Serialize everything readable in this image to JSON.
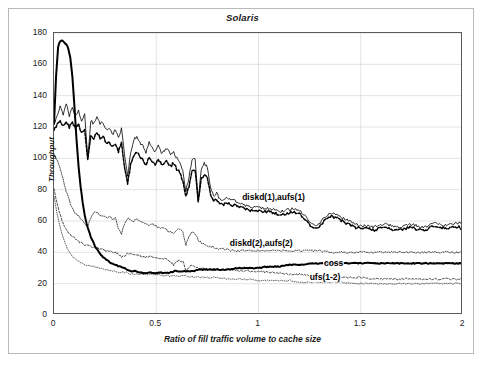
{
  "chart_data": {
    "type": "line",
    "title": "Solaris",
    "xlabel": "Ratio of fill traffic volume to cache size",
    "ylabel": "Throughput",
    "xlim": [
      0,
      2
    ],
    "ylim": [
      0,
      180
    ],
    "xticks": [
      "0",
      "0.5",
      "1",
      "1.5",
      "2"
    ],
    "xtick_values": [
      0,
      0.5,
      1,
      1.5,
      2
    ],
    "yticks": [
      "0",
      "20",
      "40",
      "60",
      "80",
      "100",
      "120",
      "140",
      "160",
      "180"
    ],
    "ytick_values": [
      0,
      20,
      40,
      60,
      80,
      100,
      120,
      140,
      160,
      180
    ],
    "grid": true,
    "grid_axis": "y",
    "legend": "inline-annotations",
    "annotations": [
      {
        "text": "diskd(1),aufs(1)",
        "x": 0.92,
        "y": 74
      },
      {
        "text": "diskd(2),aufs(2)",
        "x": 0.86,
        "y": 45
      },
      {
        "text": "coss",
        "x": 1.32,
        "y": 32
      },
      {
        "text": "ufs(1-2)",
        "x": 1.25,
        "y": 23
      }
    ],
    "series": [
      {
        "name": "aufs(1)",
        "style": "solid-thin",
        "color": "#000000",
        "x": [
          0,
          0.015,
          0.03,
          0.045,
          0.06,
          0.075,
          0.09,
          0.105,
          0.12,
          0.135,
          0.15,
          0.165,
          0.18,
          0.195,
          0.21,
          0.225,
          0.24,
          0.255,
          0.27,
          0.285,
          0.3,
          0.315,
          0.33,
          0.345,
          0.36,
          0.375,
          0.39,
          0.405,
          0.42,
          0.435,
          0.45,
          0.465,
          0.48,
          0.495,
          0.51,
          0.525,
          0.54,
          0.555,
          0.57,
          0.585,
          0.6,
          0.615,
          0.63,
          0.645,
          0.66,
          0.675,
          0.69,
          0.705,
          0.72,
          0.735,
          0.75,
          0.765,
          0.78,
          0.795,
          0.81,
          0.825,
          0.84,
          0.855,
          0.87,
          0.885,
          0.9,
          0.93,
          0.96,
          0.99,
          1.02,
          1.05,
          1.08,
          1.11,
          1.14,
          1.17,
          1.2,
          1.23,
          1.26,
          1.29,
          1.32,
          1.35,
          1.38,
          1.41,
          1.44,
          1.47,
          1.5,
          1.53,
          1.56,
          1.59,
          1.62,
          1.65,
          1.68,
          1.71,
          1.74,
          1.77,
          1.8,
          1.83,
          1.86,
          1.89,
          1.92,
          1.95,
          1.98,
          2
        ],
        "y": [
          121,
          127,
          133,
          128,
          135,
          127,
          132,
          127,
          131,
          123,
          128,
          100,
          124,
          122,
          126,
          122,
          123,
          118,
          120,
          115,
          118,
          113,
          119,
          103,
          88,
          104,
          112,
          114,
          110,
          108,
          104,
          110,
          107,
          104,
          108,
          103,
          105,
          106,
          102,
          104,
          100,
          98,
          92,
          79,
          88,
          99,
          100,
          73,
          93,
          97,
          94,
          82,
          76,
          78,
          74,
          73,
          75,
          74,
          73,
          73,
          72,
          70,
          69,
          69,
          68,
          68,
          67,
          66,
          67,
          68,
          67,
          63,
          58,
          57,
          62,
          65,
          64,
          62,
          60,
          58,
          57,
          57,
          56,
          57,
          58,
          57,
          56,
          57,
          58,
          57,
          56,
          57,
          59,
          58,
          57,
          58,
          59,
          57
        ]
      },
      {
        "name": "diskd(1)",
        "style": "dashed-bold",
        "color": "#000000",
        "x": [
          0,
          0.015,
          0.03,
          0.045,
          0.06,
          0.075,
          0.09,
          0.105,
          0.12,
          0.135,
          0.15,
          0.165,
          0.18,
          0.195,
          0.21,
          0.225,
          0.24,
          0.255,
          0.27,
          0.285,
          0.3,
          0.315,
          0.33,
          0.345,
          0.36,
          0.375,
          0.39,
          0.405,
          0.42,
          0.435,
          0.45,
          0.465,
          0.48,
          0.495,
          0.51,
          0.525,
          0.54,
          0.555,
          0.57,
          0.585,
          0.6,
          0.615,
          0.63,
          0.645,
          0.66,
          0.675,
          0.69,
          0.705,
          0.72,
          0.735,
          0.75,
          0.765,
          0.78,
          0.795,
          0.81,
          0.825,
          0.84,
          0.855,
          0.87,
          0.885,
          0.9,
          0.93,
          0.96,
          0.99,
          1.02,
          1.05,
          1.08,
          1.11,
          1.14,
          1.17,
          1.2,
          1.23,
          1.26,
          1.29,
          1.32,
          1.35,
          1.38,
          1.41,
          1.44,
          1.47,
          1.5,
          1.53,
          1.56,
          1.59,
          1.62,
          1.65,
          1.68,
          1.71,
          1.74,
          1.77,
          1.8,
          1.83,
          1.86,
          1.89,
          1.92,
          1.95,
          1.98,
          2
        ],
        "y": [
          118,
          122,
          124,
          121,
          124,
          120,
          123,
          119,
          122,
          116,
          119,
          99,
          114,
          113,
          117,
          113,
          114,
          110,
          111,
          107,
          109,
          104,
          110,
          95,
          84,
          96,
          102,
          104,
          101,
          99,
          96,
          101,
          98,
          96,
          100,
          96,
          97,
          98,
          95,
          97,
          93,
          91,
          85,
          76,
          82,
          92,
          93,
          72,
          87,
          90,
          87,
          77,
          73,
          74,
          71,
          70,
          72,
          71,
          70,
          70,
          69,
          68,
          67,
          67,
          66,
          66,
          65,
          64,
          65,
          66,
          65,
          61,
          56,
          55,
          60,
          63,
          62,
          60,
          58,
          56,
          55,
          55,
          54,
          55,
          56,
          55,
          54,
          55,
          56,
          55,
          54,
          55,
          57,
          56,
          55,
          56,
          56,
          54
        ]
      },
      {
        "name": "aufs(2)",
        "style": "dotted-thin",
        "color": "#000000",
        "x": [
          0,
          0.01,
          0.02,
          0.03,
          0.04,
          0.05,
          0.06,
          0.07,
          0.08,
          0.09,
          0.1,
          0.11,
          0.12,
          0.135,
          0.15,
          0.165,
          0.18,
          0.195,
          0.21,
          0.225,
          0.24,
          0.255,
          0.27,
          0.285,
          0.3,
          0.315,
          0.33,
          0.345,
          0.36,
          0.375,
          0.39,
          0.405,
          0.42,
          0.435,
          0.45,
          0.465,
          0.48,
          0.495,
          0.51,
          0.525,
          0.54,
          0.555,
          0.57,
          0.585,
          0.6,
          0.615,
          0.63,
          0.645,
          0.66,
          0.675,
          0.69,
          0.705,
          0.72,
          0.735,
          0.75,
          0.78,
          0.81,
          0.84,
          0.87,
          0.9,
          0.95,
          1,
          1.05,
          1.1,
          1.15,
          1.2,
          1.25,
          1.3,
          1.35,
          1.4,
          1.45,
          1.5,
          1.55,
          1.6,
          1.65,
          1.7,
          1.75,
          1.8,
          1.85,
          1.9,
          1.95,
          2
        ],
        "y": [
          103,
          100,
          97,
          94,
          89,
          84,
          79,
          75,
          71,
          68,
          66,
          64,
          63,
          61,
          58,
          57,
          62,
          65,
          66,
          64,
          63,
          62,
          63,
          61,
          62,
          55,
          52,
          58,
          62,
          61,
          60,
          61,
          60,
          59,
          58,
          57,
          58,
          57,
          56,
          55,
          56,
          54,
          53,
          52,
          54,
          55,
          53,
          45,
          50,
          53,
          52,
          48,
          46,
          45,
          44,
          43,
          42,
          42,
          41,
          41,
          41,
          41,
          41,
          41,
          41,
          41,
          41,
          41,
          40,
          40,
          40,
          40,
          40,
          40,
          40,
          40,
          40,
          40,
          40,
          40,
          40,
          40
        ]
      },
      {
        "name": "diskd(2)",
        "style": "dashed-thin",
        "color": "#000000",
        "x": [
          0,
          0.01,
          0.02,
          0.03,
          0.04,
          0.05,
          0.06,
          0.07,
          0.08,
          0.09,
          0.1,
          0.11,
          0.12,
          0.135,
          0.15,
          0.165,
          0.18,
          0.195,
          0.21,
          0.225,
          0.24,
          0.255,
          0.27,
          0.285,
          0.3,
          0.315,
          0.33,
          0.345,
          0.36,
          0.375,
          0.39,
          0.405,
          0.42,
          0.435,
          0.45,
          0.465,
          0.48,
          0.495,
          0.51,
          0.525,
          0.54,
          0.555,
          0.57,
          0.585,
          0.6,
          0.615,
          0.63,
          0.645,
          0.66,
          0.675,
          0.69,
          0.705,
          0.72,
          0.735,
          0.75,
          0.78,
          0.81,
          0.84,
          0.87,
          0.9,
          0.95,
          1,
          1.05,
          1.1,
          1.15,
          1.2,
          1.25,
          1.3,
          1.35,
          1.4,
          1.45,
          1.5,
          1.55,
          1.6,
          1.65,
          1.7,
          1.75,
          1.8,
          1.85,
          1.9,
          1.95,
          2
        ],
        "y": [
          80,
          74,
          69,
          64,
          60,
          57,
          55,
          53,
          51,
          50,
          49,
          48,
          47,
          46,
          45,
          44,
          44,
          43,
          43,
          42,
          42,
          41,
          41,
          40,
          40,
          39,
          37,
          38,
          39,
          39,
          38,
          38,
          38,
          37,
          37,
          37,
          37,
          36,
          36,
          36,
          36,
          35,
          34,
          32,
          34,
          35,
          34,
          29,
          30,
          32,
          31,
          30,
          30,
          30,
          29,
          29,
          29,
          29,
          29,
          28,
          28,
          28,
          27,
          27,
          26,
          26,
          25,
          25,
          24,
          24,
          24,
          24,
          23,
          23,
          23,
          23,
          23,
          23,
          23,
          23,
          23,
          23
        ]
      },
      {
        "name": "coss",
        "style": "solid-bold",
        "color": "#000000",
        "x": [
          0,
          0.01,
          0.02,
          0.03,
          0.04,
          0.05,
          0.06,
          0.07,
          0.08,
          0.09,
          0.1,
          0.11,
          0.12,
          0.13,
          0.14,
          0.15,
          0.16,
          0.17,
          0.18,
          0.19,
          0.2,
          0.21,
          0.22,
          0.23,
          0.24,
          0.26,
          0.28,
          0.3,
          0.32,
          0.34,
          0.36,
          0.38,
          0.4,
          0.42,
          0.44,
          0.46,
          0.48,
          0.5,
          0.53,
          0.56,
          0.59,
          0.62,
          0.65,
          0.68,
          0.71,
          0.74,
          0.77,
          0.8,
          0.85,
          0.9,
          0.95,
          1,
          1.05,
          1.1,
          1.15,
          1.2,
          1.25,
          1.3,
          1.35,
          1.4,
          1.45,
          1.5,
          1.55,
          1.6,
          1.65,
          1.7,
          1.75,
          1.8,
          1.85,
          1.9,
          1.95,
          2
        ],
        "y": [
          122,
          152,
          171,
          175,
          175,
          174,
          173,
          170,
          164,
          152,
          133,
          112,
          95,
          82,
          72,
          64,
          58,
          54,
          50,
          47,
          44,
          42,
          40,
          38,
          37,
          35,
          33,
          32,
          31,
          30,
          29,
          28,
          28,
          27,
          27,
          27,
          27,
          27,
          27,
          27,
          28,
          28,
          28,
          28,
          29,
          29,
          29,
          29,
          29,
          30,
          30,
          30,
          31,
          31,
          32,
          32,
          33,
          33,
          33,
          33,
          33,
          33,
          33,
          33,
          33,
          33,
          33,
          33,
          33,
          33,
          33,
          33
        ]
      },
      {
        "name": "ufs(1-2)",
        "style": "dotted-fine",
        "color": "#000000",
        "x": [
          0,
          0.01,
          0.02,
          0.03,
          0.04,
          0.05,
          0.06,
          0.07,
          0.08,
          0.09,
          0.1,
          0.12,
          0.14,
          0.16,
          0.18,
          0.2,
          0.22,
          0.24,
          0.26,
          0.28,
          0.3,
          0.32,
          0.34,
          0.36,
          0.38,
          0.4,
          0.45,
          0.5,
          0.55,
          0.6,
          0.65,
          0.7,
          0.75,
          0.8,
          0.85,
          0.9,
          0.95,
          1,
          1.05,
          1.1,
          1.15,
          1.2,
          1.25,
          1.3,
          1.35,
          1.4,
          1.45,
          1.5,
          1.55,
          1.6,
          1.65,
          1.7,
          1.75,
          1.8,
          1.85,
          1.9,
          1.95,
          2
        ],
        "y": [
          76,
          68,
          62,
          56,
          51,
          47,
          44,
          41,
          39,
          37,
          36,
          34,
          33,
          32,
          31,
          31,
          30,
          29,
          29,
          28,
          28,
          27,
          27,
          27,
          26,
          26,
          26,
          26,
          25,
          25,
          25,
          24,
          24,
          24,
          23,
          23,
          23,
          22,
          22,
          22,
          22,
          21,
          21,
          21,
          21,
          21,
          20,
          20,
          20,
          20,
          20,
          20,
          20,
          20,
          20,
          20,
          20,
          20
        ]
      }
    ]
  }
}
